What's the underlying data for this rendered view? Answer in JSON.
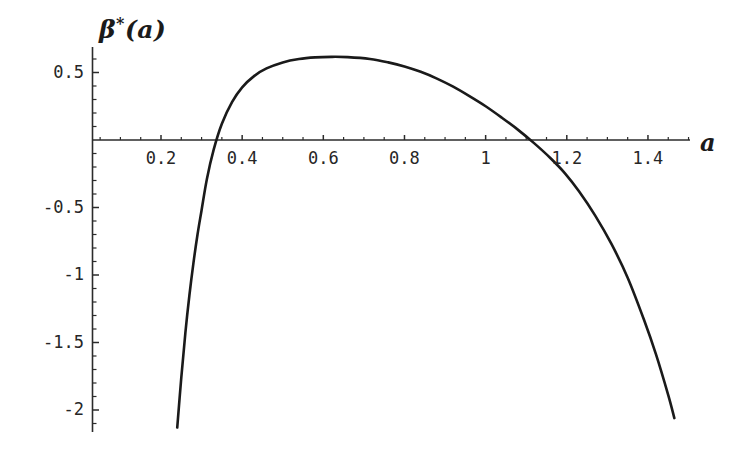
{
  "figure": {
    "background_color": "#ffffff",
    "curve_color": "#1a1a1a",
    "axis_color": "#2b2b2b"
  },
  "labels": {
    "ylabel_beta": "β",
    "ylabel_star": "*",
    "ylabel_arg": "(a)",
    "xlabel": "a"
  },
  "chart_data": {
    "type": "line",
    "title": "",
    "xlabel": "a",
    "ylabel": "β*(a)",
    "xlim": [
      0.195,
      1.51
    ],
    "ylim": [
      -2.15,
      0.72
    ],
    "grid": false,
    "legend": null,
    "xticks": [
      0.2,
      0.4,
      0.6,
      0.8,
      1,
      1.2,
      1.4
    ],
    "xtick_labels": [
      "0.2",
      "0.4",
      "0.6",
      "0.8",
      "1",
      "1.2",
      "1.4"
    ],
    "yticks": [
      0.5,
      -0.5,
      -1,
      -1.5,
      -2
    ],
    "ytick_labels": [
      "0.5",
      "-0.5",
      "-1",
      "-1.5",
      "-2"
    ],
    "minor_tick_step_x": 0.05,
    "minor_tick_step_y": 0.1,
    "annotations": [],
    "series": [
      {
        "name": "β*(a)",
        "color": "#1a1a1a",
        "line_width": 2.6,
        "zero_crossings": [
          0.313,
          1.195
        ],
        "maximum": {
          "x": 0.715,
          "y": 0.615
        },
        "x": [
          0.24,
          0.25,
          0.26,
          0.27,
          0.28,
          0.29,
          0.3,
          0.313,
          0.33,
          0.35,
          0.375,
          0.4,
          0.43,
          0.46,
          0.5,
          0.54,
          0.58,
          0.62,
          0.66,
          0.715,
          0.76,
          0.8,
          0.84,
          0.88,
          0.92,
          0.96,
          1.0,
          1.04,
          1.08,
          1.12,
          1.16,
          1.195,
          1.23,
          1.27,
          1.31,
          1.35,
          1.39,
          1.42,
          1.45,
          1.465
        ],
        "y": [
          -2.13,
          -1.76,
          -1.43,
          -1.15,
          -0.91,
          -0.7,
          -0.52,
          -0.29,
          -0.07,
          0.12,
          0.28,
          0.39,
          0.475,
          0.53,
          0.575,
          0.6,
          0.612,
          0.616,
          0.614,
          0.6,
          0.575,
          0.545,
          0.505,
          0.455,
          0.395,
          0.325,
          0.25,
          0.165,
          0.075,
          -0.025,
          -0.135,
          -0.245,
          -0.38,
          -0.56,
          -0.77,
          -1.02,
          -1.33,
          -1.59,
          -1.89,
          -2.06
        ]
      }
    ]
  }
}
